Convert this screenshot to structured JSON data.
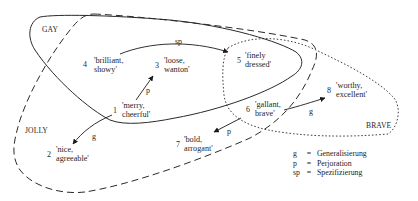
{
  "sets": {
    "gay": "GAY",
    "jolly": "JOLLY",
    "brave": "BRAVE"
  },
  "nodes": {
    "n1": {
      "num": "1",
      "line1": "'merry,",
      "line2": "cheerful'"
    },
    "n2": {
      "num": "2",
      "line1": "'nice,",
      "line2": "agreeable'"
    },
    "n3": {
      "num": "3",
      "line1": "'loose,",
      "line2": "wanton'"
    },
    "n4": {
      "num": "4",
      "line1": "'brilliant,",
      "line2": "showy'"
    },
    "n5": {
      "num": "5",
      "line1": "'finely",
      "line2": "dressed'"
    },
    "n6": {
      "num": "6",
      "line1": "'gallant,",
      "line2": "brave'"
    },
    "n7": {
      "num": "7",
      "line1": "'bold,",
      "line2": "arrogant'"
    },
    "n8": {
      "num": "8",
      "line1": "'worthy,",
      "line2": "excellent'"
    }
  },
  "edges": [
    {
      "from": "4",
      "to": "5",
      "label": "sp"
    },
    {
      "from": "1",
      "to": "3",
      "label": "p"
    },
    {
      "from": "1",
      "to": "2",
      "label": "g"
    },
    {
      "from": "6",
      "to": "7",
      "label": "p"
    },
    {
      "from": "6",
      "to": "8",
      "label": "g"
    }
  ],
  "legend": [
    {
      "key": "g",
      "eq": "=",
      "value": "Generalisierung"
    },
    {
      "key": "p",
      "eq": "=",
      "value": "Perjoration"
    },
    {
      "key": "sp",
      "eq": "=",
      "value": "Spezifizierung"
    }
  ]
}
